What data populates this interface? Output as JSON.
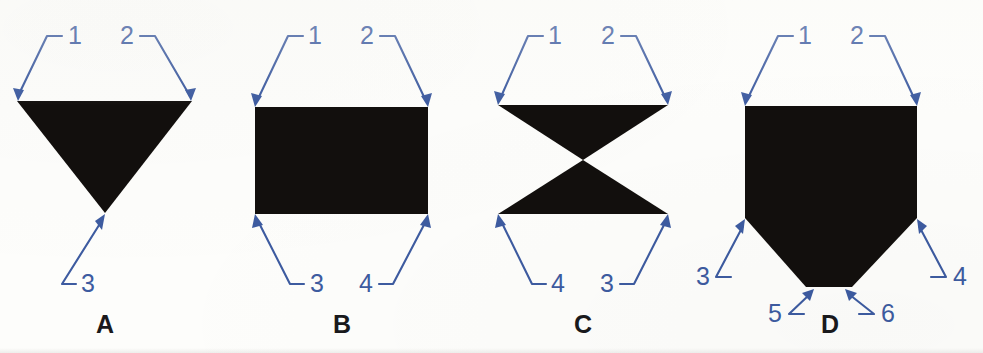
{
  "figure": {
    "background_color": "#fdfdfb",
    "shape_color": "#120f0d",
    "leader_color": "#3d5ba0",
    "letter_color": "#19191c",
    "panels": [
      {
        "letter": "A",
        "letter_x": 105,
        "letter_y": 333,
        "shape_name": "inverted-triangle",
        "shape_points": "17,101 192,101 105,213",
        "callouts": [
          {
            "id": "a-1",
            "label": "1",
            "label_x": 75,
            "label_y": 44,
            "path": "M 47,36 L 62,36 M 47,36 L 18,96",
            "arrow": "18,101 24,90 13,88"
          },
          {
            "id": "a-2",
            "label": "2",
            "label_x": 127,
            "label_y": 44,
            "path": "M 155,36 L 140,36 M 155,36 L 190,96",
            "arrow": "191,101 196,88 185,90"
          },
          {
            "id": "a-3",
            "label": "3",
            "label_x": 88,
            "label_y": 292,
            "path": "M 62,284 L 76,284 M 62,284 L 101,222",
            "arrow": "105,214 95,221 102,230"
          }
        ]
      },
      {
        "letter": "B",
        "letter_x": 342,
        "letter_y": 333,
        "shape_name": "rectangle",
        "shape_points": "255,107 428,107 428,214 255,214",
        "callouts": [
          {
            "id": "b-1",
            "label": "1",
            "label_x": 315,
            "label_y": 44,
            "path": "M 288,36 L 303,36 M 288,36 L 257,101",
            "arrow": "255,107 262,96 251,93"
          },
          {
            "id": "b-2",
            "label": "2",
            "label_x": 367,
            "label_y": 44,
            "path": "M 395,36 L 380,36 M 395,36 L 426,101",
            "arrow": "428,107 432,93 421,96"
          },
          {
            "id": "b-3",
            "label": "3",
            "label_x": 317,
            "label_y": 292,
            "path": "M 290,284 L 304,284 M 290,284 L 258,221",
            "arrow": "255,214 252,228 263,225"
          },
          {
            "id": "b-4",
            "label": "4",
            "label_x": 366,
            "label_y": 292,
            "path": "M 393,284 L 379,284 M 393,284 L 426,221",
            "arrow": "428,214 420,225 431,228"
          }
        ]
      },
      {
        "letter": "C",
        "letter_x": 583,
        "letter_y": 333,
        "shape_name": "bowtie-hourglass",
        "shape_points_top": "498,105 668,105 583,160",
        "shape_points_bottom": "583,160 668,214 498,214",
        "callouts": [
          {
            "id": "c-1",
            "label": "1",
            "label_x": 555,
            "label_y": 44,
            "path": "M 528,36 L 543,36 M 528,36 L 500,99",
            "arrow": "498,105 505,94 494,91"
          },
          {
            "id": "c-2",
            "label": "2",
            "label_x": 608,
            "label_y": 44,
            "path": "M 636,36 L 621,36 M 636,36 L 666,99",
            "arrow": "668,105 672,91 661,94"
          },
          {
            "id": "c-4",
            "label": "4",
            "label_x": 558,
            "label_y": 292,
            "path": "M 532,284 L 546,284 M 532,284 L 501,221",
            "arrow": "498,214 495,228 506,225"
          },
          {
            "id": "c-3",
            "label": "3",
            "label_x": 607,
            "label_y": 292,
            "path": "M 634,284 L 620,284 M 634,284 L 666,221",
            "arrow": "668,214 660,225 671,228"
          }
        ]
      },
      {
        "letter": "D",
        "letter_x": 830,
        "letter_y": 333,
        "shape_name": "pentagon-home-plate",
        "shape_points": "745,106 917,106 917,218 852,287 806,287 745,218",
        "callouts": [
          {
            "id": "d-1",
            "label": "1",
            "label_x": 805,
            "label_y": 44,
            "path": "M 778,36 L 793,36 M 778,36 L 747,100",
            "arrow": "745,106 752,95 741,92"
          },
          {
            "id": "d-2",
            "label": "2",
            "label_x": 857,
            "label_y": 44,
            "path": "M 885,36 L 870,36 M 885,36 L 915,100",
            "arrow": "917,106 921,92 910,95"
          },
          {
            "id": "d-3",
            "label": "3",
            "label_x": 703,
            "label_y": 285,
            "path": "M 716,277 L 731,277 M 716,277 L 743,226",
            "arrow": "745,219 735,226 743,234"
          },
          {
            "id": "d-4",
            "label": "4",
            "label_x": 960,
            "label_y": 285,
            "path": "M 946,277 L 931,277 M 946,277 L 919,226",
            "arrow": "917,219 919,234 927,226"
          },
          {
            "id": "d-5",
            "label": "5",
            "label_x": 775,
            "label_y": 322,
            "path": "M 789,314 L 804,314 M 789,314 L 809,295",
            "arrow": "814,289 802,293 810,301"
          },
          {
            "id": "d-6",
            "label": "6",
            "label_x": 888,
            "label_y": 322,
            "path": "M 874,314 L 859,314 M 874,314 L 850,295",
            "arrow": "845,289 849,301 857,293"
          }
        ]
      }
    ]
  }
}
